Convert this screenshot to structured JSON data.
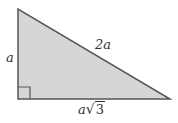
{
  "diagram": {
    "type": "right-triangle",
    "colors": {
      "fill": "#d6d6d6",
      "stroke": "#555555",
      "text": "#333333"
    },
    "vertices": {
      "top": [
        18,
        9
      ],
      "right_angle": [
        18,
        99
      ],
      "right": [
        170,
        99
      ]
    },
    "right_angle_marker": true,
    "labels": {
      "vertical_side": "a",
      "hypotenuse": "2a",
      "base_variable": "a",
      "base_sqrt_symbol": "√",
      "base_radicand": "3"
    }
  }
}
